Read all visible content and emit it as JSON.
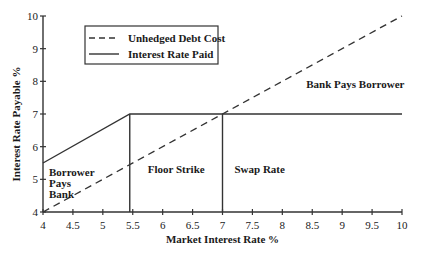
{
  "chart_data": {
    "type": "line",
    "title": "",
    "xlabel": "Market Interest Rate %",
    "ylabel": "Interest Rate Payable %",
    "xlim": [
      4,
      10
    ],
    "ylim": [
      4,
      10
    ],
    "grid": false,
    "legend_position": "upper-left (inset box)",
    "x_ticks": [
      "4",
      "4.5",
      "5",
      "5.5",
      "6",
      "6.5",
      "7",
      "7.5",
      "8",
      "8.5",
      "9",
      "9.5",
      "10"
    ],
    "y_ticks": [
      "4",
      "5",
      "6",
      "7",
      "8",
      "9",
      "10"
    ],
    "series": [
      {
        "name": "Unhedged Debt Cost",
        "style": "dashed",
        "points": [
          [
            4,
            4
          ],
          [
            10,
            10
          ]
        ]
      },
      {
        "name": "Interest Rate Paid",
        "style": "solid",
        "points": [
          [
            4,
            5.5
          ],
          [
            5.45,
            7
          ],
          [
            10,
            7
          ]
        ]
      }
    ],
    "reference_lines": [
      {
        "type": "vertical",
        "x": 5.45,
        "from_y": 4,
        "to_y": 7,
        "label": "Floor Strike"
      },
      {
        "type": "vertical",
        "x": 7,
        "from_y": 4,
        "to_y": 7,
        "label": "Swap Rate"
      }
    ],
    "annotations": [
      {
        "text": "Borrower Pays Bank",
        "lines": [
          "Borrower",
          "Pays",
          "Bank"
        ],
        "x": 4.1,
        "y": 5.1
      },
      {
        "text": "Floor Strike",
        "x": 5.75,
        "y": 5.2
      },
      {
        "text": "Swap Rate",
        "x": 7.2,
        "y": 5.2
      },
      {
        "text": "Bank Pays Borrower",
        "x": 8.4,
        "y": 7.8
      }
    ]
  },
  "labels": {
    "xlabel": "Market Interest Rate %",
    "ylabel": "Interest Rate Payable %",
    "legend": [
      "Unhedged Debt Cost",
      "Interest Rate Paid"
    ],
    "borrower": [
      "Borrower",
      "Pays",
      "Bank"
    ],
    "floor": "Floor Strike",
    "swap": "Swap Rate",
    "bank": "Bank Pays Borrower"
  }
}
